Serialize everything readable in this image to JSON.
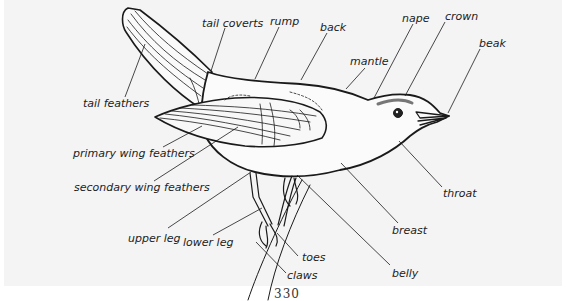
{
  "diagram": {
    "labels": [
      {
        "id": "tail-coverts",
        "text": "tail coverts",
        "x": 202,
        "y": 18
      },
      {
        "id": "rump",
        "text": "rump",
        "x": 270,
        "y": 16
      },
      {
        "id": "back",
        "text": "back",
        "x": 320,
        "y": 22
      },
      {
        "id": "nape",
        "text": "nape",
        "x": 402,
        "y": 13
      },
      {
        "id": "crown",
        "text": "crown",
        "x": 445,
        "y": 11
      },
      {
        "id": "beak",
        "text": "beak",
        "x": 479,
        "y": 38
      },
      {
        "id": "mantle",
        "text": "mantle",
        "x": 350,
        "y": 56
      },
      {
        "id": "tail-feathers",
        "text": "tail feathers",
        "x": 83,
        "y": 98
      },
      {
        "id": "primary-wing-feathers",
        "text": "primary wing feathers",
        "x": 73,
        "y": 148
      },
      {
        "id": "secondary-wing-feathers",
        "text": "secondary wing feathers",
        "x": 74,
        "y": 182
      },
      {
        "id": "throat",
        "text": "throat",
        "x": 443,
        "y": 188
      },
      {
        "id": "breast",
        "text": "breast",
        "x": 392,
        "y": 225
      },
      {
        "id": "upper-leg",
        "text": "upper leg",
        "x": 128,
        "y": 233
      },
      {
        "id": "lower-leg",
        "text": "lower leg",
        "x": 183,
        "y": 237
      },
      {
        "id": "toes",
        "text": "toes",
        "x": 302,
        "y": 252
      },
      {
        "id": "claws",
        "text": "claws",
        "x": 287,
        "y": 270
      },
      {
        "id": "belly",
        "text": "belly",
        "x": 392,
        "y": 268
      }
    ],
    "page_number": "330"
  }
}
